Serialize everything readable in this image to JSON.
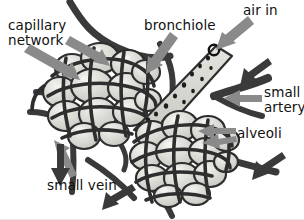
{
  "figure": {
    "background_color": "#ffffff"
  },
  "palette": {
    "vessel_dark": "#3a3a3a",
    "vessel_outline": "#2e2e2e",
    "alveoli_fill": "#d2d2cd",
    "alveoli_highlight": "#efefea",
    "bronchiole_fill": "#d8d8d3",
    "bronchiole_speckle": "#1d1d1d",
    "pointer_gray": "#8a8a8a",
    "flow_arrow_dark": "#3a3a3a",
    "text": "#111111"
  },
  "labels": {
    "capillary_network": "capillary\nnetwork",
    "bronchiole": "bronchiole",
    "air_in": "air in",
    "small_artery": "small\nartery",
    "alveoli": "alveoli",
    "small_vein": "small vein"
  },
  "annotations": [
    {
      "name": "capillary-network",
      "text": "capillary\nnetwork",
      "x": 8,
      "y": 18,
      "pointers": 2,
      "pointer_color": "#8a8a8a"
    },
    {
      "name": "bronchiole",
      "text": "bronchiole",
      "x": 144,
      "y": 18,
      "pointers": 1,
      "pointer_color": "#8a8a8a"
    },
    {
      "name": "air-in",
      "text": "air in",
      "x": 243,
      "y": 3,
      "pointers": 1,
      "pointer_color": "#8a8a8a"
    },
    {
      "name": "small-artery",
      "text": "small\nartery",
      "x": 264,
      "y": 85,
      "pointers": 1,
      "pointer_color": "#8a8a8a"
    },
    {
      "name": "alveoli",
      "text": "alveoli",
      "x": 237,
      "y": 126,
      "pointers": 2,
      "pointer_color": "#8a8a8a"
    },
    {
      "name": "small-vein",
      "text": "small vein",
      "x": 47,
      "y": 178,
      "pointers": 1,
      "pointer_color": "#8a8a8a"
    }
  ],
  "flow_arrows": [
    {
      "name": "air-in-flow",
      "direction": "down-left",
      "color": "#8a8a8a"
    },
    {
      "name": "artery-inflow-top",
      "direction": "down-left",
      "color": "#3a3a3a"
    },
    {
      "name": "artery-inflow-bottom",
      "direction": "up-left",
      "color": "#3a3a3a"
    },
    {
      "name": "vein-outflow-down",
      "direction": "down",
      "color": "#3a3a3a"
    },
    {
      "name": "vein-outflow-left",
      "direction": "down-left",
      "color": "#3a3a3a"
    }
  ]
}
